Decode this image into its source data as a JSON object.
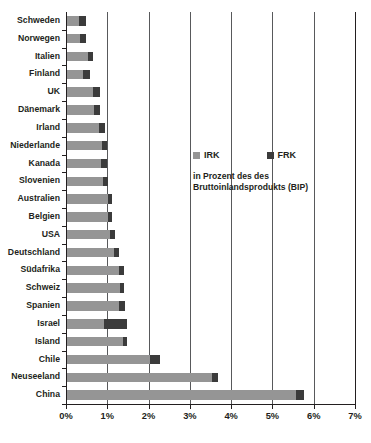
{
  "chart_data": {
    "type": "bar",
    "orientation": "horizontal",
    "stacked": true,
    "title": "",
    "subtitle_lines": [
      "in Prozent des des",
      "Bruttoinlandsprodukts (BIP)"
    ],
    "xlabel": "",
    "ylabel": "",
    "xlim": [
      0,
      7
    ],
    "xticks": [
      0,
      1,
      2,
      3,
      4,
      5,
      6,
      7
    ],
    "xtick_labels": [
      "0%",
      "1%",
      "2%",
      "3%",
      "4%",
      "5%",
      "6%",
      "7%"
    ],
    "grid": true,
    "legend_position": "inside-right",
    "colors": {
      "irk": "#959595",
      "frk": "#3b3b3b",
      "axis": "#231f20",
      "gridline": "#58595b",
      "gridline_faint": "#a7a9ac"
    },
    "categories": [
      "Schweden",
      "Norwegen",
      "Italien",
      "Finland",
      "UK",
      "Dänemark",
      "Irland",
      "Niederlande",
      "Kanada",
      "Slovenien",
      "Australien",
      "Belgien",
      "USA",
      "Deutschland",
      "Südafrika",
      "Schweiz",
      "Spanien",
      "Israel",
      "Island",
      "Chile",
      "Neuseeland",
      "China"
    ],
    "series": [
      {
        "name": "IRK",
        "values": [
          0.3,
          0.32,
          0.5,
          0.38,
          0.62,
          0.65,
          0.78,
          0.85,
          0.82,
          0.88,
          1.0,
          1.0,
          1.05,
          1.15,
          1.25,
          1.28,
          1.25,
          0.9,
          1.35,
          2.0,
          3.5,
          5.55
        ]
      },
      {
        "name": "FRK",
        "values": [
          0.15,
          0.15,
          0.12,
          0.17,
          0.18,
          0.15,
          0.14,
          0.12,
          0.16,
          0.12,
          0.08,
          0.08,
          0.12,
          0.1,
          0.13,
          0.1,
          0.15,
          0.55,
          0.1,
          0.25,
          0.15,
          0.2
        ]
      }
    ],
    "totals": [
      0.45,
      0.47,
      0.62,
      0.55,
      0.8,
      0.8,
      0.92,
      0.97,
      0.98,
      1.0,
      1.08,
      1.08,
      1.17,
      1.25,
      1.38,
      1.38,
      1.4,
      1.45,
      1.45,
      2.25,
      3.65,
      5.75
    ]
  },
  "legend": {
    "items": [
      {
        "label": "IRK",
        "key": "irk"
      },
      {
        "label": "FRK",
        "key": "frk"
      }
    ]
  }
}
